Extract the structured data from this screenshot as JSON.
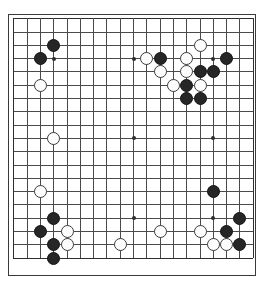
{
  "app": {
    "title": "Go Board Position",
    "board_label": "go-board"
  },
  "board": {
    "size": 19,
    "line_color": "#4a4a4a",
    "edge_color": "#2e2e2e",
    "background_color": "#ffffff",
    "black_color": "#262626",
    "white_color": "#fdfdfd",
    "stone_diameter": 13,
    "origin_x": 13.3,
    "origin_y": 18.2,
    "spacing": 13.3,
    "star_points": [
      {
        "col": 4,
        "row": 4
      },
      {
        "col": 10,
        "row": 4
      },
      {
        "col": 16,
        "row": 4
      },
      {
        "col": 4,
        "row": 10
      },
      {
        "col": 10,
        "row": 10
      },
      {
        "col": 16,
        "row": 10
      },
      {
        "col": 4,
        "row": 16
      },
      {
        "col": 10,
        "row": 16
      },
      {
        "col": 16,
        "row": 16
      }
    ],
    "stones": [
      {
        "col": 4,
        "row": 3,
        "color": "black"
      },
      {
        "col": 3,
        "row": 4,
        "color": "black"
      },
      {
        "col": 11,
        "row": 4,
        "color": "white"
      },
      {
        "col": 12,
        "row": 4,
        "color": "black"
      },
      {
        "col": 14,
        "row": 4,
        "color": "white"
      },
      {
        "col": 17,
        "row": 4,
        "color": "black"
      },
      {
        "col": 15,
        "row": 3,
        "color": "white"
      },
      {
        "col": 12,
        "row": 5,
        "color": "white"
      },
      {
        "col": 14,
        "row": 5,
        "color": "white"
      },
      {
        "col": 15,
        "row": 5,
        "color": "black"
      },
      {
        "col": 16,
        "row": 5,
        "color": "black"
      },
      {
        "col": 3,
        "row": 6,
        "color": "white"
      },
      {
        "col": 13,
        "row": 6,
        "color": "white"
      },
      {
        "col": 14,
        "row": 6,
        "color": "black"
      },
      {
        "col": 15,
        "row": 6,
        "color": "white"
      },
      {
        "col": 14,
        "row": 7,
        "color": "black"
      },
      {
        "col": 15,
        "row": 7,
        "color": "black"
      },
      {
        "col": 4,
        "row": 10,
        "color": "white"
      },
      {
        "col": 3,
        "row": 14,
        "color": "white"
      },
      {
        "col": 16,
        "row": 14,
        "color": "black"
      },
      {
        "col": 4,
        "row": 16,
        "color": "black"
      },
      {
        "col": 18,
        "row": 16,
        "color": "black"
      },
      {
        "col": 3,
        "row": 17,
        "color": "black"
      },
      {
        "col": 5,
        "row": 17,
        "color": "white"
      },
      {
        "col": 12,
        "row": 17,
        "color": "white"
      },
      {
        "col": 15,
        "row": 17,
        "color": "white"
      },
      {
        "col": 17,
        "row": 17,
        "color": "black"
      },
      {
        "col": 4,
        "row": 18,
        "color": "black"
      },
      {
        "col": 5,
        "row": 18,
        "color": "white"
      },
      {
        "col": 9,
        "row": 18,
        "color": "white"
      },
      {
        "col": 16,
        "row": 18,
        "color": "white"
      },
      {
        "col": 17,
        "row": 18,
        "color": "white"
      },
      {
        "col": 18,
        "row": 18,
        "color": "black"
      },
      {
        "col": 4,
        "row": 19,
        "color": "black"
      }
    ]
  }
}
